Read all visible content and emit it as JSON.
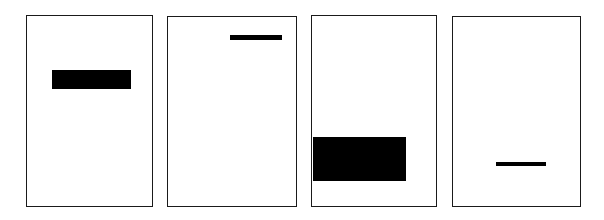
{
  "canvas": {
    "width": 604,
    "height": 220,
    "background_color": "#ffffff",
    "ink_color": "#000000",
    "border_color": "#1a1a1a"
  },
  "composition": {
    "kind": "abstract-minimalist-panels",
    "panel_count": 4,
    "description": "Four outlined portrait rectangles, each containing a single solid black horizontal bar"
  },
  "panels": [
    {
      "id": "panel-1",
      "index": 1,
      "frame": {
        "x": 26,
        "y": 15,
        "width": 127,
        "height": 192
      },
      "bar": {
        "name": "thick-bar-upper-left",
        "x": 25,
        "y": 54,
        "width": 79,
        "height": 19,
        "weight": "thick",
        "vertical_position": "upper",
        "horizontal_position": "left-of-center",
        "touches_frame_edge": false
      }
    },
    {
      "id": "panel-2",
      "index": 2,
      "frame": {
        "x": 167,
        "y": 16,
        "width": 130,
        "height": 191
      },
      "bar": {
        "name": "thin-bar-top-right",
        "x": 62,
        "y": 18,
        "width": 52,
        "height": 5,
        "weight": "thin",
        "vertical_position": "top",
        "horizontal_position": "right-of-center",
        "touches_frame_edge": false
      }
    },
    {
      "id": "panel-3",
      "index": 3,
      "frame": {
        "x": 311,
        "y": 15,
        "width": 126,
        "height": 192
      },
      "bar": {
        "name": "large-block-lower-left",
        "x": 1,
        "y": 121,
        "width": 93,
        "height": 44,
        "weight": "block",
        "vertical_position": "lower",
        "horizontal_position": "flush-left",
        "touches_frame_edge": true
      }
    },
    {
      "id": "panel-4",
      "index": 4,
      "frame": {
        "x": 452,
        "y": 16,
        "width": 129,
        "height": 191
      },
      "bar": {
        "name": "thin-bar-lower-center",
        "x": 43,
        "y": 145,
        "width": 50,
        "height": 4,
        "weight": "thin",
        "vertical_position": "lower",
        "horizontal_position": "center",
        "touches_frame_edge": false
      }
    }
  ]
}
